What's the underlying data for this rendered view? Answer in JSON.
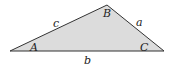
{
  "diagram": {
    "type": "triangle",
    "fill_color": "#dcdcdc",
    "stroke_color": "#333333",
    "vertices": [
      {
        "name": "A",
        "x": 10,
        "y": 51,
        "label": "A",
        "label_x": 30,
        "label_y": 51
      },
      {
        "name": "B",
        "x": 107,
        "y": 5,
        "label": "B",
        "label_x": 103,
        "label_y": 17
      },
      {
        "name": "C",
        "x": 164,
        "y": 51,
        "label": "C",
        "label_x": 140,
        "label_y": 51
      }
    ],
    "sides": [
      {
        "name": "a",
        "label": "a",
        "label_x": 136,
        "label_y": 26
      },
      {
        "name": "b",
        "label": "b",
        "label_x": 84,
        "label_y": 64
      },
      {
        "name": "c",
        "label": "c",
        "label_x": 53,
        "label_y": 27
      }
    ]
  }
}
